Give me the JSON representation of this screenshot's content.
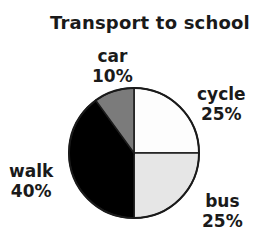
{
  "chart_data": {
    "type": "pie",
    "title": "Transport to school",
    "slices": [
      {
        "label": "cycle",
        "value": 25,
        "value_label": "25%",
        "color": "#fdfdfd"
      },
      {
        "label": "bus",
        "value": 25,
        "value_label": "25%",
        "color": "#e6e6e6"
      },
      {
        "label": "walk",
        "value": 40,
        "value_label": "40%",
        "color": "#000000"
      },
      {
        "label": "car",
        "value": 10,
        "value_label": "10%",
        "color": "#7b7b7b"
      }
    ],
    "start_angle_deg": 0,
    "direction": "clockwise",
    "legend": "none",
    "outline_color": "#1a1a1a"
  }
}
